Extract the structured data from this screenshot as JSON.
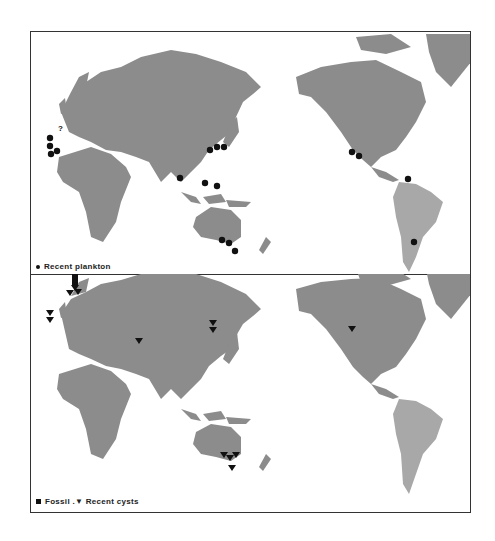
{
  "figure": {
    "top_panel": {
      "legend": {
        "symbol": "circle",
        "label": "Recent  plankton"
      },
      "markers": [
        {
          "type": "circle",
          "x": 19,
          "y": 106
        },
        {
          "type": "circle",
          "x": 19,
          "y": 114
        },
        {
          "type": "circle",
          "x": 20,
          "y": 122
        },
        {
          "type": "circle",
          "x": 26,
          "y": 119
        },
        {
          "type": "circle",
          "x": 179,
          "y": 118
        },
        {
          "type": "circle",
          "x": 186,
          "y": 115
        },
        {
          "type": "circle",
          "x": 193,
          "y": 115
        },
        {
          "type": "circle",
          "x": 149,
          "y": 146
        },
        {
          "type": "circle",
          "x": 174,
          "y": 151
        },
        {
          "type": "circle",
          "x": 186,
          "y": 154
        },
        {
          "type": "circle",
          "x": 191,
          "y": 208
        },
        {
          "type": "circle",
          "x": 198,
          "y": 211
        },
        {
          "type": "circle",
          "x": 204,
          "y": 219
        },
        {
          "type": "circle",
          "x": 321,
          "y": 120
        },
        {
          "type": "circle",
          "x": 328,
          "y": 124
        },
        {
          "type": "circle",
          "x": 377,
          "y": 147
        },
        {
          "type": "circle",
          "x": 383,
          "y": 210
        }
      ],
      "annotations": [
        {
          "text": "?",
          "x": 28,
          "y": 98
        }
      ]
    },
    "bottom_panel": {
      "legend": {
        "fossil_label": "Fossil",
        "separator": " .",
        "recent_label": "Recent  cysts"
      },
      "markers": [
        {
          "type": "square",
          "x": 44,
          "y": 4
        },
        {
          "type": "square",
          "x": 44,
          "y": 9
        },
        {
          "type": "triangle",
          "x": 44,
          "y": 12
        },
        {
          "type": "triangle",
          "x": 39,
          "y": 18
        },
        {
          "type": "triangle",
          "x": 47,
          "y": 17
        },
        {
          "type": "triangle",
          "x": 19,
          "y": 38
        },
        {
          "type": "triangle",
          "x": 19,
          "y": 45
        },
        {
          "type": "triangle",
          "x": 108,
          "y": 66
        },
        {
          "type": "triangle",
          "x": 182,
          "y": 48
        },
        {
          "type": "triangle",
          "x": 182,
          "y": 55
        },
        {
          "type": "triangle",
          "x": 321,
          "y": 54
        },
        {
          "type": "triangle",
          "x": 193,
          "y": 180
        },
        {
          "type": "triangle",
          "x": 199,
          "y": 183
        },
        {
          "type": "triangle",
          "x": 205,
          "y": 180
        },
        {
          "type": "triangle",
          "x": 201,
          "y": 193
        }
      ]
    },
    "colors": {
      "land": "#8c8c8c",
      "land_americas": "#a8a8a8",
      "frame": "#333333",
      "marker": "#111111",
      "background": "#ffffff"
    }
  }
}
